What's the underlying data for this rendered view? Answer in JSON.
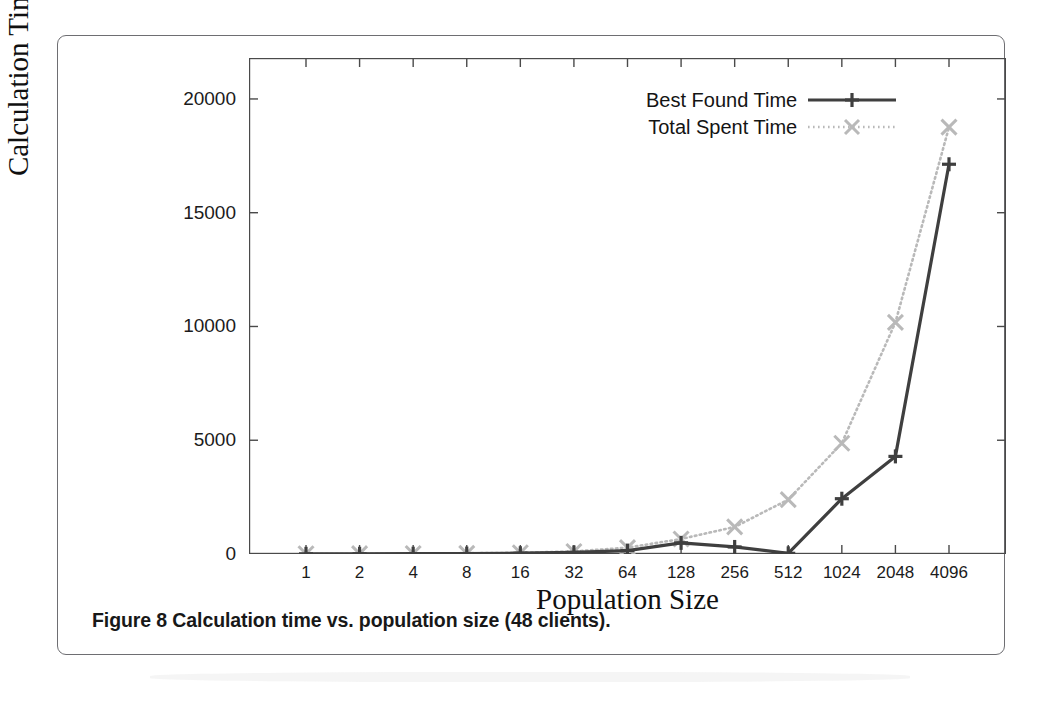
{
  "figure": {
    "caption": "Figure 8 Calculation time vs. population size (48 clients)."
  },
  "chart_data": {
    "type": "line",
    "title": "",
    "xlabel": "Population Size",
    "ylabel": "Calculation Time [sec]",
    "categories": [
      "1",
      "2",
      "4",
      "8",
      "16",
      "32",
      "64",
      "128",
      "256",
      "512",
      "1024",
      "2048",
      "4096"
    ],
    "xtick_labels": [
      "1",
      "2",
      "4",
      "8",
      "16",
      "32",
      "64",
      "128",
      "256",
      "512",
      "1024",
      "2048",
      "4096"
    ],
    "ytick_labels": [
      "0",
      "5000",
      "10000",
      "15000",
      "20000"
    ],
    "yticks": [
      0,
      5000,
      10000,
      15000,
      20000
    ],
    "ylim": [
      0,
      21800
    ],
    "grid": false,
    "legend_position": "top-right",
    "series": [
      {
        "name": "Best Found Time",
        "color": "#3f3f3f",
        "linestyle": "solid",
        "marker": "plus",
        "values": [
          8,
          10,
          14,
          20,
          35,
          70,
          150,
          490,
          310,
          30,
          2430,
          4290,
          17130
        ]
      },
      {
        "name": "Total Spent Time",
        "color": "#b9b9b9",
        "linestyle": "dotted",
        "marker": "cross",
        "values": [
          10,
          14,
          20,
          30,
          55,
          110,
          280,
          660,
          1190,
          2390,
          4870,
          10180,
          18760
        ]
      }
    ]
  },
  "legend": {
    "items": [
      {
        "label": "Best Found Time"
      },
      {
        "label": "Total Spent Time"
      }
    ]
  }
}
